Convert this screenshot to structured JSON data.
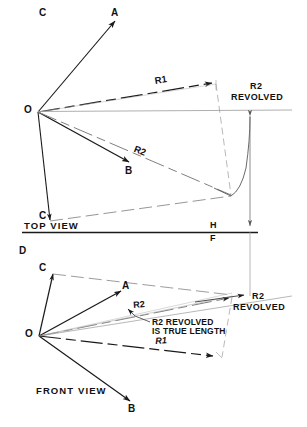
{
  "figure": {
    "type": "engineering-drawing",
    "background_color": "#ffffff",
    "line_color": "#1a1a1a",
    "thin_line_color": "#8a8a8a"
  },
  "top_view": {
    "step_label": "C",
    "view_name": "TOP VIEW",
    "points": {
      "origin": "O",
      "a": "A",
      "b": "B",
      "c": "C"
    },
    "dimensions": {
      "r1": "R1",
      "r2": "R2",
      "r2_revolved_line1": "R2",
      "r2_revolved_line2": "REVOLVED"
    }
  },
  "fold_line": {
    "upper": "H",
    "lower": "F"
  },
  "front_view": {
    "step_label": "D",
    "view_name": "FRONT VIEW",
    "points": {
      "origin": "O",
      "a": "A",
      "b": "B",
      "c": "C"
    },
    "dimensions": {
      "r1": "R1",
      "r2": "R2",
      "r2_revolved_line1": "R2",
      "r2_revolved_line2": "REVOLVED"
    },
    "note_line1": "R2 REVOLVED",
    "note_line2": "IS TRUE LENGTH"
  }
}
